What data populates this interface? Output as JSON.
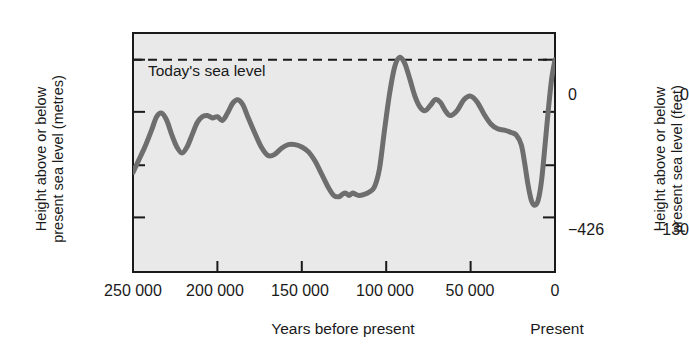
{
  "figure": {
    "plot_bg_color": "#e9e9e9",
    "curve_color": "#6e6e6e",
    "axis_color": "#1a1a1a"
  },
  "axes": {
    "left_title_line1": "Height above or below",
    "left_title_line2": "present sea level (metres)",
    "right_title_line1": "Height above or below",
    "right_title_line2": "present sea level (feet)",
    "x_title": "Years before present",
    "present_label": "Present",
    "y_left_ticks": [
      "0",
      "−130"
    ],
    "y_right_ticks": [
      "0",
      "−426"
    ],
    "x_ticks": [
      "250 000",
      "200 000",
      "150 000",
      "100 000",
      "50 000",
      "0"
    ]
  },
  "annotations": {
    "sea_level": "Today's sea level"
  },
  "chart_data": {
    "type": "line",
    "title": "",
    "xlabel": "Years before present",
    "ylabel": "Height above or below present sea level (metres)",
    "ylabel_secondary": "Height above or below present sea level (feet)",
    "xlim": [
      250000,
      0
    ],
    "ylim": [
      -175,
      22
    ],
    "x_tick_values": [
      250000,
      200000,
      150000,
      100000,
      50000,
      0
    ],
    "x_tick_labels": [
      "250 000",
      "200 000",
      "150 000",
      "100 000",
      "50 000",
      "0"
    ],
    "y_tick_values": [
      22,
      0,
      -43,
      -87,
      -130
    ],
    "y_left_tick_labels": [
      "",
      "0",
      "",
      "",
      "−130"
    ],
    "y_right_tick_labels": [
      "",
      "0",
      "",
      "",
      "−426"
    ],
    "grid": false,
    "legend": false,
    "reference_line": {
      "y": 0,
      "style": "dashed",
      "label": "Today's sea level"
    },
    "series": [
      {
        "name": "Sea level",
        "x": [
          250000,
          247000,
          243000,
          239000,
          236000,
          233000,
          230000,
          227000,
          224000,
          221000,
          218000,
          215000,
          212000,
          209000,
          206000,
          203000,
          200000,
          197000,
          194000,
          191000,
          188000,
          185000,
          182000,
          178000,
          174000,
          170000,
          166000,
          162000,
          158000,
          154000,
          150000,
          146000,
          142000,
          138000,
          134000,
          131000,
          128000,
          126000,
          124000,
          122000,
          120000,
          118000,
          116000,
          113000,
          110000,
          107000,
          104000,
          101000,
          98000,
          95000,
          92000,
          89000,
          86000,
          83000,
          80000,
          77000,
          74000,
          71000,
          68000,
          65000,
          62000,
          58000,
          54000,
          50000,
          46000,
          42000,
          38000,
          34000,
          30000,
          26000,
          23000,
          20000,
          18000,
          16000,
          14000,
          12000,
          10000,
          8000,
          6000,
          4000,
          2000,
          0
        ],
        "y": [
          -93,
          -84,
          -72,
          -58,
          -47,
          -44,
          -50,
          -62,
          -72,
          -77,
          -72,
          -62,
          -52,
          -47,
          -46,
          -48,
          -47,
          -50,
          -44,
          -36,
          -33,
          -37,
          -47,
          -60,
          -72,
          -79,
          -78,
          -73,
          -70,
          -70,
          -72,
          -76,
          -84,
          -95,
          -106,
          -112,
          -113,
          -111,
          -110,
          -112,
          -110,
          -111,
          -112,
          -111,
          -109,
          -105,
          -90,
          -58,
          -28,
          -6,
          2,
          -3,
          -16,
          -30,
          -39,
          -42,
          -38,
          -33,
          -35,
          -42,
          -46,
          -42,
          -33,
          -30,
          -35,
          -45,
          -53,
          -57,
          -58,
          -60,
          -62,
          -70,
          -85,
          -103,
          -116,
          -120,
          -116,
          -100,
          -72,
          -42,
          -16,
          0
        ],
        "color": "#6e6e6e",
        "linewidth": 5
      }
    ]
  }
}
